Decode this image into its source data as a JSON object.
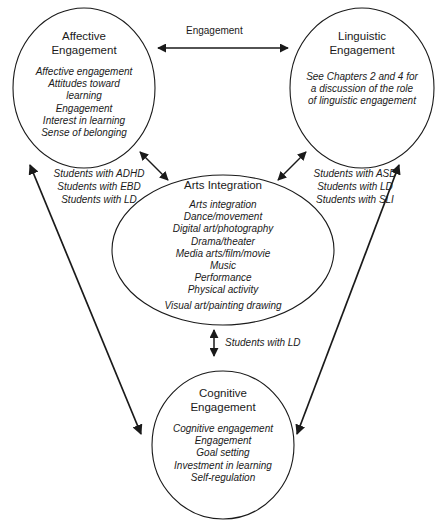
{
  "diagram": {
    "type": "concept-map",
    "nodes": [
      {
        "id": "affective",
        "title": "Affective\nEngagement",
        "items": [
          "Affective engagement",
          "Attitudes toward",
          "learning",
          "Engagement",
          "Interest in learning",
          "Sense of belonging"
        ]
      },
      {
        "id": "linguistic",
        "title": "Linguistic\nEngagement",
        "items": [
          "See Chapters 2 and 4 for",
          "a discussion of the role",
          "of linguistic engagement"
        ]
      },
      {
        "id": "arts",
        "title": "Arts Integration",
        "items": [
          "Arts integration",
          "Dance/movement",
          "Digital art/photography",
          "Drama/theater",
          "Media arts/film/movie",
          "Music",
          "Performance",
          "Physical activity"
        ],
        "extra_items": [
          "Visual art/painting drawing"
        ]
      },
      {
        "id": "cognitive",
        "title": "Cognitive\nEngagement",
        "items": [
          "Cognitive engagement",
          "Engagement",
          "Goal setting",
          "Investment in learning",
          "Self-regulation"
        ]
      }
    ],
    "edges": [
      {
        "id": "affective-linguistic",
        "from": "affective",
        "to": "linguistic",
        "label": "Engagement",
        "style": "double-arrow",
        "label_style": "plain"
      },
      {
        "id": "affective-arts",
        "from": "affective",
        "to": "arts",
        "label": "",
        "style": "double-arrow",
        "label_style": "italic"
      },
      {
        "id": "linguistic-arts",
        "from": "linguistic",
        "to": "arts",
        "label": "",
        "style": "double-arrow",
        "label_style": "italic"
      },
      {
        "id": "arts-cognitive",
        "from": "arts",
        "to": "cognitive",
        "label": "Students with LD",
        "style": "double-arrow",
        "label_style": "italic"
      },
      {
        "id": "affective-cognitive",
        "from": "affective",
        "to": "cognitive",
        "label": "",
        "style": "double-arrow",
        "label_style": "italic"
      },
      {
        "id": "linguistic-cognitive",
        "from": "linguistic",
        "to": "cognitive",
        "label": "",
        "style": "double-arrow",
        "label_style": "italic"
      }
    ],
    "side_labels": {
      "left": [
        "Students with ADHD",
        "Students with EBD",
        "Students with LD"
      ],
      "right": [
        "Students with ASD",
        "Students with LD",
        "Students with SLI"
      ]
    },
    "colors": {
      "stroke": "#1a1a1a",
      "text": "#1a1a1a",
      "background": "#ffffff"
    }
  }
}
